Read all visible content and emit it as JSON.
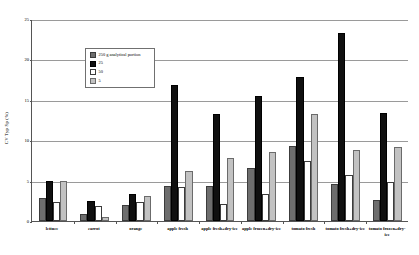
{
  "chart_data": {
    "type": "bar",
    "title": "",
    "xlabel": "",
    "ylabel": "CV Typ Sp (%)",
    "ylim": [
      0,
      25
    ],
    "yticks": [
      0,
      5,
      10,
      15,
      20,
      25
    ],
    "grid": true,
    "legend_position": "inside-upper-left",
    "categories": [
      "lettuce",
      "carrot",
      "orange",
      "apple fresh",
      "apple fresh+dry-ice",
      "apple frozen+dry-ice",
      "tomato fresh",
      "tomato fresh+dry-ice",
      "tomato frozen+dry-ice"
    ],
    "series": [
      {
        "name": "250 g analytical portion",
        "color": "#6e6e6e",
        "values": [
          2.8,
          0.9,
          2.0,
          4.3,
          4.3,
          6.5,
          9.3,
          4.6,
          2.6
        ]
      },
      {
        "name": "25",
        "color": "#101010",
        "values": [
          4.9,
          2.5,
          3.3,
          16.8,
          13.3,
          15.5,
          17.8,
          23.3,
          13.4
        ]
      },
      {
        "name": "50",
        "color": "#ffffff",
        "values": [
          2.4,
          1.8,
          2.3,
          4.2,
          2.1,
          3.3,
          7.4,
          5.7,
          4.8
        ]
      },
      {
        "name": "5",
        "color": "#c2c2c2",
        "values": [
          4.9,
          0.5,
          3.1,
          6.2,
          7.8,
          8.6,
          13.3,
          8.8,
          9.1
        ]
      }
    ]
  },
  "legend": {
    "items": [
      {
        "label": "250 g analytical portion"
      },
      {
        "label": "25"
      },
      {
        "label": "50"
      },
      {
        "label": "5"
      }
    ]
  }
}
